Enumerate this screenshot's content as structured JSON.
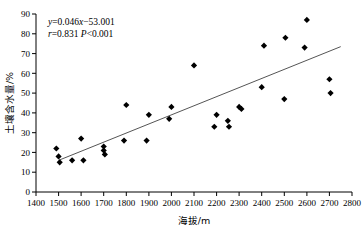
{
  "chart_data": {
    "type": "scatter",
    "title": "",
    "xlabel": "海拔/m",
    "ylabel": "土壤含水量/%",
    "xlim": [
      1400,
      2800
    ],
    "ylim": [
      0,
      90
    ],
    "xticks": [
      1400,
      1500,
      1600,
      1700,
      1800,
      1900,
      2000,
      2100,
      2200,
      2300,
      2400,
      2500,
      2600,
      2700,
      2800
    ],
    "yticks": [
      0,
      10,
      20,
      30,
      40,
      50,
      60,
      70,
      80,
      90
    ],
    "grid": false,
    "legend": null,
    "marker": "filled-diamond",
    "marker_color": "#000000",
    "points": [
      {
        "x": 1490,
        "y": 22
      },
      {
        "x": 1500,
        "y": 18
      },
      {
        "x": 1505,
        "y": 15
      },
      {
        "x": 1560,
        "y": 16
      },
      {
        "x": 1600,
        "y": 27
      },
      {
        "x": 1610,
        "y": 16
      },
      {
        "x": 1700,
        "y": 23
      },
      {
        "x": 1700,
        "y": 21
      },
      {
        "x": 1705,
        "y": 19
      },
      {
        "x": 1790,
        "y": 26
      },
      {
        "x": 1800,
        "y": 44
      },
      {
        "x": 1890,
        "y": 26
      },
      {
        "x": 1900,
        "y": 39
      },
      {
        "x": 1990,
        "y": 37
      },
      {
        "x": 2000,
        "y": 43
      },
      {
        "x": 2100,
        "y": 64
      },
      {
        "x": 2190,
        "y": 33
      },
      {
        "x": 2200,
        "y": 39
      },
      {
        "x": 2250,
        "y": 36
      },
      {
        "x": 2255,
        "y": 33
      },
      {
        "x": 2300,
        "y": 43
      },
      {
        "x": 2310,
        "y": 42
      },
      {
        "x": 2400,
        "y": 53
      },
      {
        "x": 2410,
        "y": 74
      },
      {
        "x": 2500,
        "y": 47
      },
      {
        "x": 2505,
        "y": 78
      },
      {
        "x": 2590,
        "y": 73
      },
      {
        "x": 2600,
        "y": 87
      },
      {
        "x": 2700,
        "y": 57
      },
      {
        "x": 2705,
        "y": 50
      }
    ],
    "trendline": {
      "equation_slope": 0.046,
      "equation_intercept": -53.001,
      "x_start": 1500,
      "x_end": 2750,
      "color": "#555555"
    },
    "annotations": {
      "equation": "y=0.046x−53.001",
      "equation_y_var": "y",
      "equation_body": "=0.046",
      "equation_x_var": "x",
      "equation_tail": "−53.001",
      "stats_r_var": "r",
      "stats_r_value": "=0.831",
      "stats_p_var": "P",
      "stats_p_value": "<0.001",
      "stats": "r=0.831 P<0.001"
    }
  }
}
